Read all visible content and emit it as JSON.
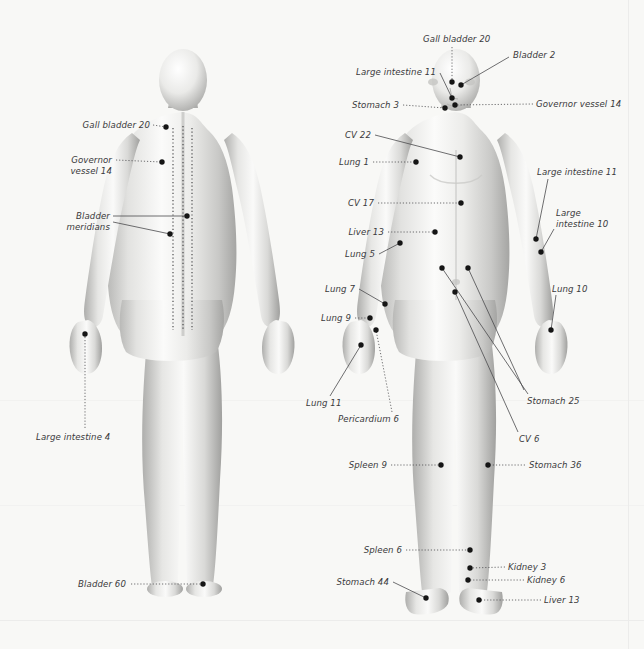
{
  "figure": {
    "title_visible": false,
    "background_color": "#f8f8f6",
    "label_color": "#3a3a3c",
    "point_color": "#151515",
    "leader_color": "#4a4a4c",
    "meridian_color": "#3d3d3f",
    "skin_light": "#fdfdfd",
    "skin_mid": "#d8d8d6",
    "skin_shadow": "#9a9a99"
  },
  "chart_data": {
    "type": "diagram",
    "views": [
      "posterior (back)",
      "anterior (front)"
    ],
    "point_count": 28,
    "meridian_lines": [
      {
        "name": "Bladder meridian left",
        "view": "posterior",
        "style": "dotted-vertical"
      },
      {
        "name": "Governor vessel",
        "view": "posterior",
        "style": "dotted-vertical"
      },
      {
        "name": "Bladder meridian right",
        "view": "posterior",
        "style": "dotted-vertical"
      }
    ]
  },
  "back_view": {
    "name": "posterior-figure",
    "labels": [
      {
        "id": "gb20-back",
        "text": "Gall bladder 20",
        "align": "r",
        "x": 40,
        "y": 120,
        "w": 110,
        "leader": [
          [
            153,
            125
          ],
          [
            166,
            127
          ]
        ],
        "dotted": true,
        "point": [
          166,
          127
        ]
      },
      {
        "id": "gv14-back",
        "text": "Governor\nvessel 14",
        "align": "r",
        "x": 36,
        "y": 155,
        "w": 76,
        "leader": [
          [
            116,
            160
          ],
          [
            162,
            162
          ]
        ],
        "dotted": true,
        "point": [
          162,
          162
        ]
      },
      {
        "id": "bl-mer-1",
        "text": "Bladder\nmeridians",
        "align": "r",
        "x": 36,
        "y": 211,
        "w": 74,
        "leader": [
          [
            113,
            216
          ],
          [
            187,
            216
          ]
        ],
        "dotted": false,
        "point": [
          187,
          216
        ]
      },
      {
        "id": "bl-mer-2",
        "text": "",
        "align": "r",
        "x": 0,
        "y": 0,
        "w": 0,
        "leader": [
          [
            113,
            222
          ],
          [
            170,
            234
          ]
        ],
        "dotted": false,
        "point": [
          170,
          234
        ]
      },
      {
        "id": "li4-back",
        "text": "Large intestine 4",
        "align": "l",
        "x": 36,
        "y": 432,
        "w": 110,
        "leader": [
          [
            85,
            428
          ],
          [
            85,
            334
          ]
        ],
        "dotted": true,
        "point": [
          85,
          334
        ]
      },
      {
        "id": "bl60-back",
        "text": "Bladder 60",
        "align": "r",
        "x": 52,
        "y": 579,
        "w": 74,
        "leader": [
          [
            131,
            584
          ],
          [
            203,
            584
          ]
        ],
        "dotted": true,
        "point": [
          203,
          584
        ]
      }
    ]
  },
  "front_view": {
    "name": "anterior-figure",
    "labels": [
      {
        "id": "gb20-front",
        "text": "Gall bladder 20",
        "align": "l",
        "x": 423,
        "y": 34,
        "w": 96,
        "leader": [
          [
            452,
            47
          ],
          [
            452,
            82
          ]
        ],
        "dotted": true,
        "point": [
          452,
          82
        ]
      },
      {
        "id": "bl2",
        "text": "Bladder 2",
        "align": "l",
        "x": 513,
        "y": 50,
        "w": 70,
        "leader": [
          [
            509,
            57
          ],
          [
            461,
            85
          ]
        ],
        "dotted": false,
        "point": [
          461,
          85
        ]
      },
      {
        "id": "li11-head",
        "text": "Large intestine 11",
        "align": "r",
        "x": 330,
        "y": 67,
        "w": 106,
        "leader": [
          [
            440,
            73
          ],
          [
            452,
            98
          ]
        ],
        "dotted": false,
        "point": [
          452,
          98
        ]
      },
      {
        "id": "gv14-front",
        "text": "Governor vessel 14",
        "align": "l",
        "x": 536,
        "y": 99,
        "w": 104,
        "leader": [
          [
            533,
            104
          ],
          [
            455,
            105
          ]
        ],
        "dotted": true,
        "point": [
          455,
          105
        ]
      },
      {
        "id": "st3",
        "text": "Stomach 3",
        "align": "r",
        "x": 337,
        "y": 100,
        "w": 62,
        "leader": [
          [
            403,
            105
          ],
          [
            445,
            108
          ]
        ],
        "dotted": true,
        "point": [
          445,
          108
        ]
      },
      {
        "id": "cv22",
        "text": "CV 22",
        "align": "r",
        "x": 333,
        "y": 130,
        "w": 38,
        "leader": [
          [
            375,
            135
          ],
          [
            460,
            157
          ]
        ],
        "dotted": false,
        "point": [
          460,
          157
        ]
      },
      {
        "id": "lung1",
        "text": "Lung 1",
        "align": "r",
        "x": 325,
        "y": 157,
        "w": 44,
        "leader": [
          [
            373,
            162
          ],
          [
            416,
            162
          ]
        ],
        "dotted": true,
        "point": [
          416,
          162
        ]
      },
      {
        "id": "li11-arm",
        "text": "Large intestine 11",
        "align": "l",
        "x": 537,
        "y": 167,
        "w": 106,
        "leader": [
          [
            548,
            179
          ],
          [
            536,
            239
          ]
        ],
        "dotted": false,
        "point": [
          536,
          239
        ]
      },
      {
        "id": "cv17",
        "text": "CV 17",
        "align": "r",
        "x": 336,
        "y": 198,
        "w": 38,
        "leader": [
          [
            378,
            203
          ],
          [
            461,
            203
          ]
        ],
        "dotted": true,
        "point": [
          461,
          203
        ]
      },
      {
        "id": "li10",
        "text": "Large\nintestine 10",
        "align": "l",
        "x": 556,
        "y": 208,
        "w": 62,
        "leader": [
          [
            554,
            229
          ],
          [
            541,
            252
          ]
        ],
        "dotted": false,
        "point": [
          541,
          252
        ]
      },
      {
        "id": "liver13-t",
        "text": "Liver 13",
        "align": "r",
        "x": 330,
        "y": 227,
        "w": 54,
        "leader": [
          [
            388,
            232
          ],
          [
            435,
            232
          ]
        ],
        "dotted": true,
        "point": [
          435,
          232
        ]
      },
      {
        "id": "lung5",
        "text": "Lung 5",
        "align": "r",
        "x": 331,
        "y": 249,
        "w": 44,
        "leader": [
          [
            379,
            254
          ],
          [
            400,
            243
          ]
        ],
        "dotted": false,
        "point": [
          400,
          243
        ]
      },
      {
        "id": "lung10",
        "text": "Lung 10",
        "align": "l",
        "x": 552,
        "y": 284,
        "w": 52,
        "leader": [
          [
            556,
            295
          ],
          [
            551,
            330
          ]
        ],
        "dotted": false,
        "point": [
          551,
          330
        ]
      },
      {
        "id": "lung7",
        "text": "Lung 7",
        "align": "r",
        "x": 311,
        "y": 284,
        "w": 44,
        "leader": [
          [
            359,
            289
          ],
          [
            385,
            304
          ]
        ],
        "dotted": false,
        "point": [
          385,
          304
        ]
      },
      {
        "id": "lung9",
        "text": "Lung 9",
        "align": "r",
        "x": 307,
        "y": 313,
        "w": 44,
        "leader": [
          [
            355,
            318
          ],
          [
            370,
            318
          ]
        ],
        "dotted": true,
        "point": [
          370,
          318
        ]
      },
      {
        "id": "lung11",
        "text": "Lung 11",
        "align": "l",
        "x": 306,
        "y": 398,
        "w": 48,
        "leader": [
          [
            330,
            396
          ],
          [
            361,
            345
          ]
        ],
        "dotted": false,
        "point": [
          361,
          345
        ]
      },
      {
        "id": "peri6",
        "text": "Pericardium 6",
        "align": "l",
        "x": 338,
        "y": 414,
        "w": 78,
        "leader": [
          [
            392,
            412
          ],
          [
            376,
            330
          ]
        ],
        "dotted": true,
        "point": [
          376,
          330
        ]
      },
      {
        "id": "st25",
        "text": "Stomach 25",
        "align": "l",
        "x": 527,
        "y": 396,
        "w": 72,
        "leader": [
          [
            528,
            394
          ],
          [
            442,
            268
          ]
        ],
        "dotted": false,
        "point": [
          442,
          268
        ]
      },
      {
        "id": "st25b",
        "text": "",
        "align": "l",
        "x": 0,
        "y": 0,
        "w": 0,
        "leader": [
          [
            524,
            390
          ],
          [
            468,
            268
          ]
        ],
        "dotted": false,
        "point": [
          468,
          268
        ]
      },
      {
        "id": "cv6",
        "text": "CV 6",
        "align": "l",
        "x": 519,
        "y": 434,
        "w": 34,
        "leader": [
          [
            518,
            432
          ],
          [
            455,
            292
          ]
        ],
        "dotted": false,
        "point": [
          455,
          292
        ]
      },
      {
        "id": "spleen9",
        "text": "Spleen 9",
        "align": "r",
        "x": 333,
        "y": 460,
        "w": 54,
        "leader": [
          [
            391,
            465
          ],
          [
            441,
            465
          ]
        ],
        "dotted": true,
        "point": [
          441,
          465
        ]
      },
      {
        "id": "st36",
        "text": "Stomach 36",
        "align": "l",
        "x": 529,
        "y": 460,
        "w": 72,
        "leader": [
          [
            525,
            465
          ],
          [
            488,
            465
          ]
        ],
        "dotted": true,
        "point": [
          488,
          465
        ]
      },
      {
        "id": "spleen6",
        "text": "Spleen 6",
        "align": "r",
        "x": 348,
        "y": 545,
        "w": 54,
        "leader": [
          [
            406,
            550
          ],
          [
            470,
            550
          ]
        ],
        "dotted": true,
        "point": [
          470,
          550
        ]
      },
      {
        "id": "kidney3",
        "text": "Kidney 3",
        "align": "l",
        "x": 508,
        "y": 562,
        "w": 58,
        "leader": [
          [
            505,
            567
          ],
          [
            470,
            568
          ]
        ],
        "dotted": true,
        "point": [
          470,
          568
        ]
      },
      {
        "id": "kidney6",
        "text": "Kidney 6",
        "align": "l",
        "x": 527,
        "y": 575,
        "w": 58,
        "leader": [
          [
            524,
            580
          ],
          [
            468,
            580
          ]
        ],
        "dotted": true,
        "point": [
          468,
          580
        ]
      },
      {
        "id": "st44",
        "text": "Stomach 44",
        "align": "r",
        "x": 317,
        "y": 577,
        "w": 72,
        "leader": [
          [
            393,
            582
          ],
          [
            426,
            598
          ]
        ],
        "dotted": false,
        "point": [
          426,
          598
        ]
      },
      {
        "id": "liver13-f",
        "text": "Liver 13",
        "align": "l",
        "x": 544,
        "y": 595,
        "w": 54,
        "leader": [
          [
            541,
            600
          ],
          [
            479,
            600
          ]
        ],
        "dotted": true,
        "point": [
          479,
          600
        ]
      }
    ]
  }
}
